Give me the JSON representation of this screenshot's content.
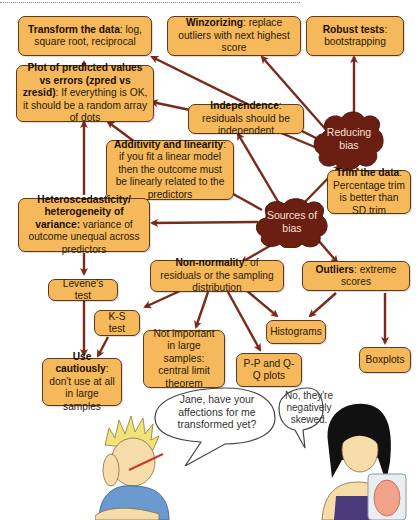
{
  "diagram": {
    "type": "concept-map",
    "colors": {
      "box_fill": "#f5b85a",
      "box_border": "#5b3a1e",
      "arrow": "#7a2a1a",
      "cloud": "#6b1e12",
      "cloud_text": "#f4e2d2"
    },
    "hubs": {
      "reducing_bias": {
        "line1": "Reducing",
        "line2": "bias"
      },
      "sources_of_bias": {
        "line1": "Sources of",
        "line2": "bias"
      }
    },
    "boxes": {
      "transform": {
        "bold": "Transform the data",
        "rest": ": log, square root, reciprocal"
      },
      "winzorizing": {
        "bold": "Winzorizing",
        "rest": ": replace outliers with next highest score"
      },
      "robust": {
        "bold": "Robust tests",
        "rest": ": bootstrapping"
      },
      "plot": {
        "bold": "Plot of predicted values vs errors (zpred vs zresid)",
        "rest": ": If everything is OK, it should be a random array of dots"
      },
      "independence": {
        "bold": "Independence",
        "rest": ": residuals should be independent"
      },
      "additivity": {
        "bold": "Additivity and linearity",
        "rest": ": if you fit a linear model then the outcome must be linearly related to the predictors"
      },
      "trim": {
        "bold": "Trim the data",
        "rest": ": Percentage trim is better than SD trim"
      },
      "hetero": {
        "bold": "Heteroscedasticity/ heterogeneity of variance:",
        "rest": " variance of outcome unequal across predictors"
      },
      "levene": {
        "bold": "",
        "rest": "Levene's test"
      },
      "nonnormality": {
        "bold": "Non-normality",
        "rest": ": of residuals or the sampling distribution"
      },
      "outliers": {
        "bold": "Outliers",
        "rest": ": extreme scores"
      },
      "ks": {
        "bold": "",
        "rest": "K-S test"
      },
      "notimportant": {
        "bold": "",
        "rest": "Not important in large samples: central limit theorem"
      },
      "histograms": {
        "bold": "",
        "rest": "Histograms"
      },
      "pp": {
        "bold": "",
        "rest": "P-P and Q-Q plots"
      },
      "boxplots": {
        "bold": "",
        "rest": "Boxplots"
      },
      "cautious": {
        "bold": "Use cautiously",
        "rest": ": don't use at all in large samples"
      }
    },
    "speech": {
      "male": "Jane, have your affections for me transformed yet?",
      "female": "No, they're negatively skewed."
    }
  }
}
